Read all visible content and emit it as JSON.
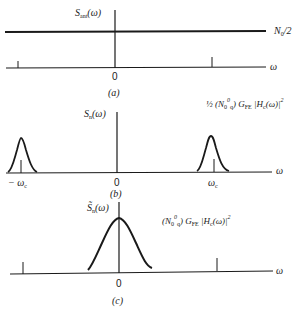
{
  "figure": {
    "panels": [
      {
        "id": "a",
        "caption": "(a)",
        "y_axis_label": "S_ant(ω)",
        "y_axis_label_main": "S",
        "y_axis_label_sub": "ant",
        "y_axis_label_arg": "(ω)",
        "curve_label": "N0/2",
        "curve_label_main": "N",
        "curve_label_sub": "0",
        "curve_label_tail": "/2",
        "x_axis_label": "ω",
        "origin_label": "0",
        "curve_type": "flat-constant"
      },
      {
        "id": "b",
        "caption": "(b)",
        "y_axis_label": "S_n(ω)",
        "y_axis_label_main": "S",
        "y_axis_label_sub": "n",
        "y_axis_label_arg": "(ω)",
        "curve_label": "½ (N0 0q) G_FE |H_c(ω)|²",
        "curve_label_frac": "½",
        "curve_label_body": "(N",
        "curve_label_sub": "0",
        "curve_label_stack_top": "0",
        "curve_label_stack_bottom": "q",
        "curve_label_close": ") G",
        "curve_label_gsub": "FE",
        "curve_label_h": " |H",
        "curve_label_hsub": "c",
        "curve_label_tail": "(ω)|",
        "curve_label_sq": "2",
        "x_axis_label": "ω",
        "origin_label": "0",
        "neg_tick_label": "− ω",
        "neg_tick_sub": "c",
        "pos_tick_label": "ω",
        "pos_tick_sub": "c",
        "curve_type": "two-bandpass-pulses"
      },
      {
        "id": "c",
        "caption": "(c)",
        "y_axis_label": "S̃_n(ω)",
        "y_axis_label_main": "S̃",
        "y_axis_label_sub": "n",
        "y_axis_label_arg": "(ω)",
        "curve_label": "(N0 0q) G_FE |H_c(ω)|²",
        "curve_label_body": "(N",
        "curve_label_sub": "0",
        "curve_label_stack_top": "0",
        "curve_label_stack_bottom": "q",
        "curve_label_close": ") G",
        "curve_label_gsub": "FE",
        "curve_label_h": " |H",
        "curve_label_hsub": "c",
        "curve_label_tail": "(ω)|",
        "curve_label_sq": "2",
        "x_axis_label": "ω",
        "origin_label": "0",
        "curve_type": "baseband-pulse"
      }
    ],
    "colors": {
      "ink": "#1a1a1a",
      "background": "#ffffff"
    }
  }
}
